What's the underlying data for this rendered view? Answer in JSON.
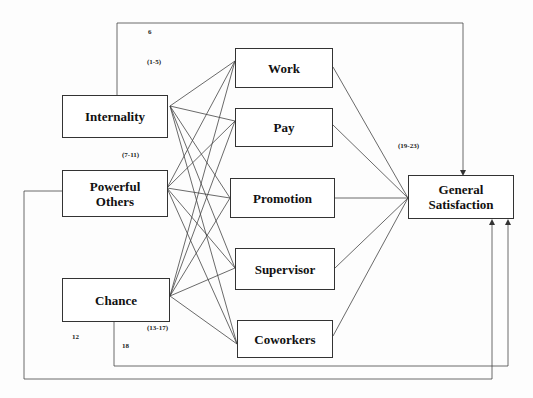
{
  "diagram": {
    "predictors": [
      {
        "id": "internality",
        "label": "Internality"
      },
      {
        "id": "powerful_others",
        "label": "Powerful Others"
      },
      {
        "id": "chance",
        "label": "Chance"
      }
    ],
    "facets": [
      {
        "id": "work",
        "label": "Work"
      },
      {
        "id": "pay",
        "label": "Pay"
      },
      {
        "id": "promotion",
        "label": "Promotion"
      },
      {
        "id": "supervisor",
        "label": "Supervisor"
      },
      {
        "id": "coworkers",
        "label": "Coworkers"
      }
    ],
    "outcome": {
      "id": "general_satisfaction",
      "label": "General Satisfaction"
    },
    "path_labels": {
      "internality_to_general": "6",
      "internality_to_facets": "(1-5)",
      "powerful_others_to_facets": "(7-11)",
      "powerful_others_to_general": "12",
      "chance_to_facets": "(13-17)",
      "chance_to_general": "18",
      "facets_to_general": "(19-23)"
    },
    "edges": [
      {
        "from": "internality",
        "to": "work"
      },
      {
        "from": "internality",
        "to": "pay"
      },
      {
        "from": "internality",
        "to": "promotion"
      },
      {
        "from": "internality",
        "to": "supervisor"
      },
      {
        "from": "internality",
        "to": "coworkers"
      },
      {
        "from": "powerful_others",
        "to": "work"
      },
      {
        "from": "powerful_others",
        "to": "pay"
      },
      {
        "from": "powerful_others",
        "to": "promotion"
      },
      {
        "from": "powerful_others",
        "to": "supervisor"
      },
      {
        "from": "powerful_others",
        "to": "coworkers"
      },
      {
        "from": "chance",
        "to": "work"
      },
      {
        "from": "chance",
        "to": "pay"
      },
      {
        "from": "chance",
        "to": "promotion"
      },
      {
        "from": "chance",
        "to": "supervisor"
      },
      {
        "from": "chance",
        "to": "coworkers"
      },
      {
        "from": "work",
        "to": "general_satisfaction"
      },
      {
        "from": "pay",
        "to": "general_satisfaction"
      },
      {
        "from": "promotion",
        "to": "general_satisfaction"
      },
      {
        "from": "supervisor",
        "to": "general_satisfaction"
      },
      {
        "from": "coworkers",
        "to": "general_satisfaction"
      },
      {
        "from": "internality",
        "to": "general_satisfaction"
      },
      {
        "from": "powerful_others",
        "to": "general_satisfaction"
      },
      {
        "from": "chance",
        "to": "general_satisfaction"
      }
    ]
  }
}
